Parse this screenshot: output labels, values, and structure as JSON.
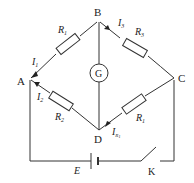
{
  "diagram": {
    "nodes": {
      "A": "A",
      "B": "B",
      "C": "C",
      "D": "D"
    },
    "galvanometer": "G",
    "resistors": {
      "ab": {
        "name": "R",
        "sub": "1"
      },
      "bc": {
        "name": "R",
        "sub": "3"
      },
      "ad": {
        "name": "R",
        "sub": "2"
      },
      "dc": {
        "name": "R",
        "sub": "1"
      }
    },
    "currents": {
      "i1": {
        "name": "I",
        "sub": "1"
      },
      "i3": {
        "name": "I",
        "sub": "3"
      },
      "i2": {
        "name": "I",
        "sub": "2"
      },
      "irx": {
        "name": "I",
        "sub": "R",
        "subsub": "1"
      }
    },
    "battery": "E",
    "switch": "K"
  }
}
